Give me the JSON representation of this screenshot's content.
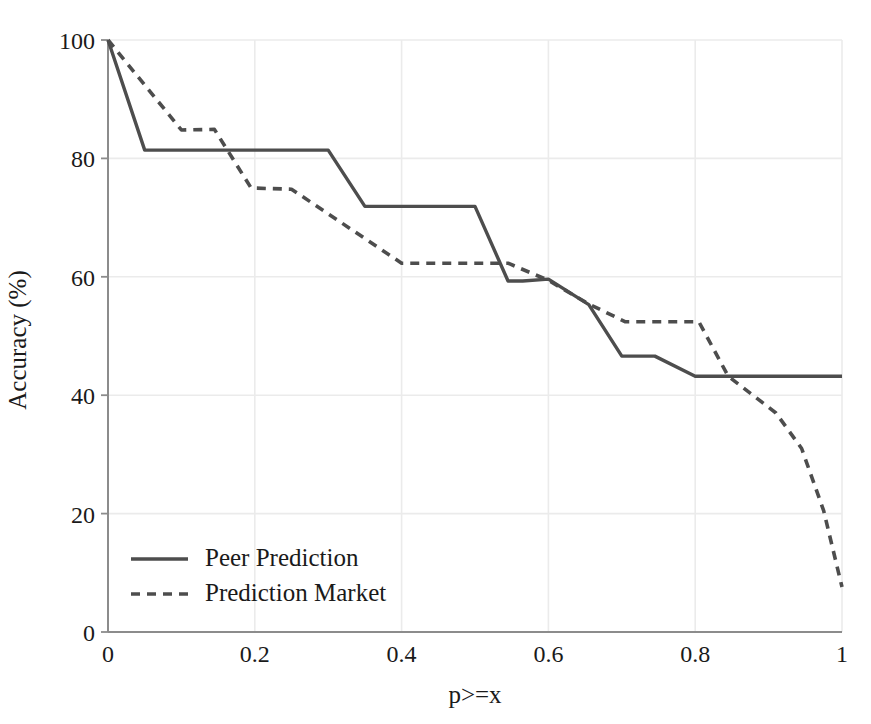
{
  "figure": {
    "background_color": "#ffffff",
    "series_color": "#4d4d4d",
    "grid_color": "#ebebeb",
    "axis_color": "#8c8c8c",
    "text_color": "#1a1a1a"
  },
  "axes": {
    "x_label": "p>=x",
    "y_label": "Accuracy (%)",
    "x_ticks": [
      "0",
      "0.2",
      "0.4",
      "0.6",
      "0.8",
      "1"
    ],
    "y_ticks": [
      "0",
      "20",
      "40",
      "60",
      "80",
      "100"
    ]
  },
  "legend": {
    "items": [
      {
        "label": "Peer Prediction",
        "style": "solid"
      },
      {
        "label": "Prediction Market",
        "style": "dashed"
      }
    ]
  },
  "chart_data": {
    "type": "line",
    "title": "",
    "subtitle": "",
    "xlabel": "p>=x",
    "ylabel": "Accuracy (%)",
    "xlim": [
      0,
      1
    ],
    "ylim": [
      0,
      100
    ],
    "xticks": [
      0,
      0.2,
      0.4,
      0.6,
      0.8,
      1
    ],
    "yticks": [
      0,
      20,
      40,
      60,
      80,
      100
    ],
    "grid": true,
    "legend_position": "lower left",
    "series": [
      {
        "name": "Peer Prediction",
        "style": "solid",
        "color": "#4d4d4d",
        "x": [
          0.0,
          0.05,
          0.3,
          0.35,
          0.5,
          0.545,
          0.565,
          0.6,
          0.655,
          0.7,
          0.745,
          0.8,
          1.0
        ],
        "y": [
          100.0,
          81.4,
          81.4,
          71.9,
          71.9,
          59.3,
          59.3,
          59.6,
          55.3,
          46.6,
          46.6,
          43.2,
          43.2
        ]
      },
      {
        "name": "Prediction Market",
        "style": "dashed",
        "color": "#4d4d4d",
        "x": [
          0.0,
          0.1,
          0.145,
          0.195,
          0.25,
          0.4,
          0.545,
          0.6,
          0.655,
          0.705,
          0.805,
          0.845,
          0.91,
          0.945,
          0.975,
          1.0
        ],
        "y": [
          100.0,
          84.8,
          84.9,
          75.0,
          74.8,
          62.3,
          62.3,
          59.4,
          55.4,
          52.4,
          52.4,
          43.2,
          37.0,
          31.0,
          20.5,
          7.6
        ]
      }
    ]
  }
}
